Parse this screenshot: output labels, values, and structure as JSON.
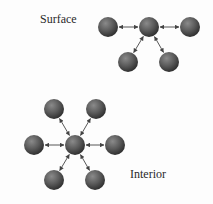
{
  "diagram": {
    "labels": {
      "surface": "Surface",
      "interior": "Interior"
    },
    "colors": {
      "sphere_highlight": "#8a8a8a",
      "sphere_mid": "#5a5a5a",
      "sphere_edge": "#2e2e2e",
      "arrow": "#444444",
      "text": "#2a2a2a"
    },
    "sphere_radius": 10,
    "surface_group": {
      "center": {
        "x": 149,
        "y": 27
      },
      "neighbors": [
        {
          "x": 108,
          "y": 27
        },
        {
          "x": 190,
          "y": 27
        },
        {
          "x": 128,
          "y": 62
        },
        {
          "x": 169,
          "y": 62
        }
      ]
    },
    "interior_group": {
      "center": {
        "x": 75,
        "y": 145
      },
      "neighbors": [
        {
          "x": 54,
          "y": 109
        },
        {
          "x": 96,
          "y": 109
        },
        {
          "x": 34,
          "y": 145
        },
        {
          "x": 115,
          "y": 145
        },
        {
          "x": 54,
          "y": 180
        },
        {
          "x": 95,
          "y": 180
        }
      ]
    }
  }
}
